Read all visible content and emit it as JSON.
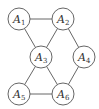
{
  "diagram": {
    "type": "undirected-graph",
    "nodes": [
      {
        "id": "A1",
        "label": "A",
        "sub": "1",
        "x": 19,
        "y": 19
      },
      {
        "id": "A2",
        "label": "A",
        "sub": "2",
        "x": 63,
        "y": 19
      },
      {
        "id": "A3",
        "label": "A",
        "sub": "3",
        "x": 41,
        "y": 57
      },
      {
        "id": "A4",
        "label": "A",
        "sub": "4",
        "x": 84,
        "y": 57
      },
      {
        "id": "A5",
        "label": "A",
        "sub": "5",
        "x": 19,
        "y": 94
      },
      {
        "id": "A6",
        "label": "A",
        "sub": "6",
        "x": 63,
        "y": 94
      }
    ],
    "edges": [
      [
        "A1",
        "A2"
      ],
      [
        "A1",
        "A3"
      ],
      [
        "A2",
        "A3"
      ],
      [
        "A2",
        "A4"
      ],
      [
        "A3",
        "A5"
      ],
      [
        "A3",
        "A6"
      ],
      [
        "A4",
        "A6"
      ],
      [
        "A5",
        "A6"
      ]
    ],
    "node_radius": 11,
    "colors": {
      "stroke": "#555555",
      "text": "#333333",
      "fill": "#ffffff"
    }
  }
}
